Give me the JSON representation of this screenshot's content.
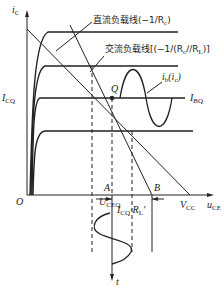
{
  "figure": {
    "type": "transistor output characteristics with DC and AC load lines",
    "axes": {
      "y_label": "i",
      "y_label_sub": "C",
      "x_label": "u",
      "x_label_sub": "CE",
      "origin": "O"
    },
    "annotations": {
      "dc_load_line": "直流负载线(−1/R",
      "dc_load_line_sub": "c",
      "dc_load_line_end": ")",
      "ac_load_line": "交流负载线[(−1/(R",
      "ac_load_line_sub1": "c",
      "ac_load_line_mid": "//R",
      "ac_load_line_sub2": "L",
      "ac_load_line_end": ")]",
      "ib_wave": "i",
      "ib_wave_sub": "b",
      "ib_wave_paren": "(i",
      "ib_wave_paren_sub": "c",
      "ib_wave_close": ")",
      "icq": "I",
      "icq_sub": "CQ",
      "ibq": "I",
      "ibq_sub": "BQ",
      "q_point": "Q",
      "point_a": "A",
      "point_b": "B",
      "uceq": "U",
      "uceq_sub": "CEQ",
      "vcc": "V",
      "vcc_sub": "CC",
      "span_label": "I",
      "span_label_sub": "CQ",
      "span_label_mid": "·R",
      "span_label_sub2": "L",
      "span_label_prime": "′",
      "time_axis": "t"
    },
    "colors": {
      "line": "#222222",
      "background": "#ffffff"
    }
  }
}
